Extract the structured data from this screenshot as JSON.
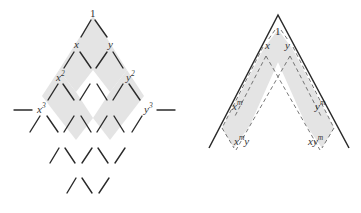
{
  "left_diagram": {
    "description": "Lattice of monomials in x and y with shaded diamond regions",
    "labels": {
      "apex": "1",
      "x1": "x",
      "y1": "y",
      "x2_base": "x",
      "x2_exp": "2",
      "y2_base": "y",
      "y2_exp": "2",
      "x3_base": "x",
      "x3_exp": "3",
      "y3_base": "y",
      "y3_exp": "3"
    }
  },
  "right_diagram": {
    "description": "Cone with dashed shaded strips from 1 to x^m y and x y^m",
    "labels": {
      "apex": "1",
      "x": "x",
      "y": "y",
      "xm_base": "x",
      "xm_exp": "m",
      "ym_base": "y",
      "ym_exp": "m",
      "xmy_base": "x",
      "xmy_exp": "m",
      "xmy_tail": "y",
      "xym_base": "xy",
      "xym_exp": "m"
    }
  },
  "colors": {
    "shade": "#e4e4e4",
    "line": "#2a2a2a"
  }
}
